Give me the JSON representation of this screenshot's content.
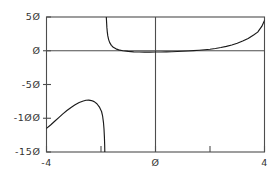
{
  "chart_data": {
    "type": "line",
    "title": "",
    "xlabel": "",
    "ylabel": "",
    "xlim": [
      -4,
      4
    ],
    "ylim": [
      -150,
      50
    ],
    "grid": false,
    "legend": null,
    "axis_lines": {
      "x_zero": true,
      "y_zero": true
    },
    "frame": "box",
    "line_color": "#1a1a1a",
    "axis_color": "#4d4d4d",
    "background_color": "#ffffff",
    "x_ticks": [
      {
        "value": -4,
        "label": "-4",
        "labeled": true
      },
      {
        "value": -2,
        "label": "",
        "labeled": false
      },
      {
        "value": 0,
        "label": "Ø",
        "labeled": true
      },
      {
        "value": 2,
        "label": "",
        "labeled": false
      },
      {
        "value": 4,
        "label": "4",
        "labeled": true
      }
    ],
    "y_ticks": [
      {
        "value": 50,
        "label": "5Ø",
        "labeled": true
      },
      {
        "value": 0,
        "label": "Ø",
        "labeled": true
      },
      {
        "value": -50,
        "label": "-5Ø",
        "labeled": true
      },
      {
        "value": -100,
        "label": "-1ØØ",
        "labeled": true
      },
      {
        "value": -150,
        "label": "-15Ø",
        "labeled": true
      }
    ],
    "asymptote_x": -1.85,
    "series": [
      {
        "name": "left-branch",
        "comment": "branch left of the vertical asymptote; rises from -115 to a local maximum near -73 then plunges below -150",
        "points": [
          [
            -4.0,
            -115.0
          ],
          [
            -3.85,
            -110.0
          ],
          [
            -3.7,
            -104.5
          ],
          [
            -3.55,
            -99.0
          ],
          [
            -3.4,
            -93.5
          ],
          [
            -3.25,
            -88.5
          ],
          [
            -3.1,
            -84.0
          ],
          [
            -2.95,
            -80.0
          ],
          [
            -2.8,
            -76.6
          ],
          [
            -2.65,
            -74.4
          ],
          [
            -2.55,
            -73.4
          ],
          [
            -2.45,
            -73.2
          ],
          [
            -2.35,
            -73.8
          ],
          [
            -2.25,
            -75.4
          ],
          [
            -2.15,
            -78.5
          ],
          [
            -2.05,
            -84.0
          ],
          [
            -1.98,
            -90.0
          ],
          [
            -1.94,
            -97.0
          ],
          [
            -1.91,
            -106.0
          ],
          [
            -1.89,
            -116.0
          ],
          [
            -1.875,
            -128.0
          ],
          [
            -1.865,
            -140.0
          ],
          [
            -1.86,
            -150.0
          ]
        ]
      },
      {
        "name": "right-branch",
        "comment": "branch right of the vertical asymptote; falls from above 50, flattens close to 0 through the origin region, then climbs to about 45 at x=4",
        "points": [
          [
            -1.805,
            50.0
          ],
          [
            -1.795,
            42.0
          ],
          [
            -1.785,
            35.0
          ],
          [
            -1.77,
            28.0
          ],
          [
            -1.75,
            22.0
          ],
          [
            -1.72,
            16.5
          ],
          [
            -1.68,
            12.0
          ],
          [
            -1.62,
            8.0
          ],
          [
            -1.55,
            5.2
          ],
          [
            -1.45,
            2.8
          ],
          [
            -1.35,
            1.3
          ],
          [
            -1.2,
            0.0
          ],
          [
            -1.0,
            -1.0
          ],
          [
            -0.8,
            -1.6
          ],
          [
            -0.6,
            -1.9
          ],
          [
            -0.4,
            -2.0
          ],
          [
            -0.2,
            -2.0
          ],
          [
            0.0,
            -1.9
          ],
          [
            0.2,
            -1.8
          ],
          [
            0.4,
            -1.6
          ],
          [
            0.6,
            -1.4
          ],
          [
            0.8,
            -1.1
          ],
          [
            1.0,
            -0.8
          ],
          [
            1.2,
            -0.4
          ],
          [
            1.4,
            0.1
          ],
          [
            1.6,
            0.7
          ],
          [
            1.8,
            1.4
          ],
          [
            2.0,
            2.3
          ],
          [
            2.2,
            3.4
          ],
          [
            2.4,
            4.8
          ],
          [
            2.6,
            6.5
          ],
          [
            2.8,
            8.6
          ],
          [
            3.0,
            11.2
          ],
          [
            3.2,
            14.4
          ],
          [
            3.4,
            18.3
          ],
          [
            3.6,
            23.2
          ],
          [
            3.75,
            27.6
          ],
          [
            3.9,
            36.0
          ],
          [
            4.0,
            45.0
          ]
        ]
      }
    ]
  }
}
